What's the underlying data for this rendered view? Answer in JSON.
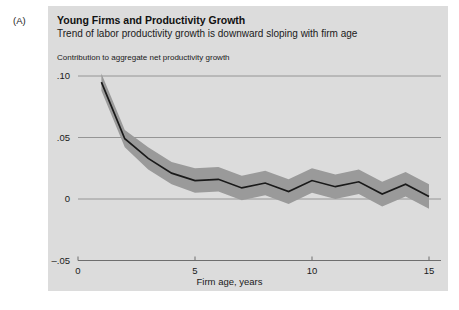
{
  "panel": {
    "label": "(A)"
  },
  "header": {
    "title": "Young Firms and Productivity Growth",
    "subtitle": "Trend of labor productivity growth is downward sloping with firm age",
    "axis_note": "Contribution to aggregate net productivity growth"
  },
  "colors": {
    "panel_background": "#dcdcdc",
    "figure_background": "#ffffff",
    "band_fill": "#9a9a9a",
    "line_stroke": "#1a1a1a",
    "gridline": "#8c8c8c",
    "axis": "#6e6e6e",
    "text": "#1a1a1a"
  },
  "chart_data": {
    "type": "line",
    "title": "Young Firms and Productivity Growth",
    "subtitle": "Trend of labor productivity growth is downward sloping with firm age",
    "xlabel": "Firm age, years",
    "ylabel": "Contribution to aggregate net productivity growth",
    "xlim": [
      0,
      15.4
    ],
    "ylim": [
      -0.05,
      0.105
    ],
    "grid": true,
    "legend": "none",
    "xticks": [
      0,
      5,
      10,
      15
    ],
    "xtick_labels": [
      "0",
      "5",
      "10",
      "15"
    ],
    "yticks": [
      -0.05,
      0,
      0.05,
      0.1
    ],
    "ytick_labels": [
      "–.05",
      "0",
      ".05",
      ".10"
    ],
    "x": [
      1,
      2,
      3,
      4,
      5,
      6,
      7,
      8,
      9,
      10,
      11,
      12,
      13,
      14,
      15
    ],
    "series": [
      {
        "name": "Point estimate",
        "values": [
          0.095,
          0.049,
          0.033,
          0.021,
          0.015,
          0.016,
          0.009,
          0.013,
          0.006,
          0.015,
          0.01,
          0.014,
          0.004,
          0.012,
          0.002
        ]
      },
      {
        "name": "Confidence band upper",
        "values": [
          0.102,
          0.056,
          0.042,
          0.03,
          0.025,
          0.026,
          0.019,
          0.023,
          0.016,
          0.025,
          0.02,
          0.024,
          0.014,
          0.022,
          0.012
        ]
      },
      {
        "name": "Confidence band lower",
        "values": [
          0.088,
          0.042,
          0.024,
          0.012,
          0.005,
          0.006,
          -0.001,
          0.003,
          -0.004,
          0.005,
          0.0,
          0.004,
          -0.006,
          0.002,
          -0.008
        ]
      }
    ]
  }
}
